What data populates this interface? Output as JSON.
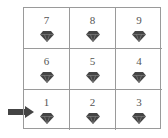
{
  "grid": {
    "rows": [
      [
        {
          "number": "7",
          "icon": "diamond-icon"
        },
        {
          "number": "8",
          "icon": "diamond-icon"
        },
        {
          "number": "9",
          "icon": "diamond-icon"
        }
      ],
      [
        {
          "number": "6",
          "icon": "diamond-icon"
        },
        {
          "number": "5",
          "icon": "diamond-icon"
        },
        {
          "number": "4",
          "icon": "diamond-icon"
        }
      ],
      [
        {
          "number": "1",
          "icon": "diamond-icon"
        },
        {
          "number": "2",
          "icon": "diamond-icon"
        },
        {
          "number": "3",
          "icon": "diamond-icon"
        }
      ]
    ]
  },
  "pointer": {
    "icon": "arrow-right-icon",
    "target_cell": "1"
  },
  "colors": {
    "grid_line": "#9a9a9a",
    "number": "#555555",
    "gem": "#444444",
    "arrow": "#444444"
  }
}
